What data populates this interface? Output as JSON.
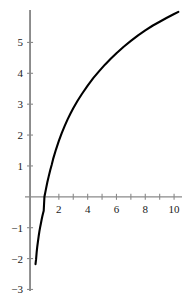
{
  "chart_data": {
    "type": "line",
    "title": "",
    "subtitle": "",
    "xlabel": "",
    "ylabel": "",
    "xlim": [
      -0.35,
      10.55
    ],
    "ylim": [
      -3.05,
      6.05
    ],
    "grid": false,
    "legend": null,
    "x_ticks_labeled": [
      2,
      4,
      6,
      8,
      10
    ],
    "x_ticks_minor": [
      1,
      3,
      5,
      7,
      9
    ],
    "x_tick_labels": [
      "2",
      "4",
      "6",
      "8",
      "10"
    ],
    "y_ticks_labeled": [
      -3,
      -2,
      -1,
      1,
      2,
      3,
      4,
      5
    ],
    "y_tick_labels": [
      "-3",
      "-2",
      "-1",
      "1",
      "2",
      "3",
      "4",
      "5"
    ],
    "x_axis_position": 0,
    "y_axis_position": 0,
    "axis_color": "#8a8a8a",
    "curve_color": "#000000",
    "curve_width": 2.1,
    "x_root": 1,
    "series": [
      {
        "name": "y = log base 1.46 of x",
        "x": [
          0.38,
          0.42,
          0.46,
          0.5,
          0.55,
          0.6,
          0.65,
          0.7,
          0.75,
          0.8,
          0.85,
          0.9,
          0.95,
          1.0,
          1.1,
          1.2,
          1.3,
          1.4,
          1.5,
          1.6,
          1.8,
          2.0,
          2.2,
          2.4,
          2.6,
          2.8,
          3.0,
          3.3,
          3.6,
          4.0,
          4.4,
          4.8,
          5.2,
          5.6,
          6.0,
          6.5,
          7.0,
          7.5,
          8.0,
          8.5,
          9.0,
          9.5,
          10.0,
          10.3
        ],
        "y": [
          -2.18,
          -2.02,
          -1.79,
          -1.62,
          -1.44,
          -1.27,
          -1.12,
          -0.99,
          -0.87,
          -0.75,
          -0.64,
          -0.54,
          -0.45,
          0.0,
          0.24,
          0.47,
          0.67,
          0.86,
          1.03,
          1.22,
          1.53,
          1.81,
          2.06,
          2.29,
          2.5,
          2.69,
          2.87,
          3.11,
          3.33,
          3.6,
          3.85,
          4.07,
          4.28,
          4.47,
          4.65,
          4.86,
          5.05,
          5.23,
          5.39,
          5.54,
          5.67,
          5.8,
          5.92,
          5.99
        ]
      }
    ]
  },
  "axes": {
    "x_axis_name": "horizontal-axis",
    "y_axis_name": "vertical-axis"
  }
}
